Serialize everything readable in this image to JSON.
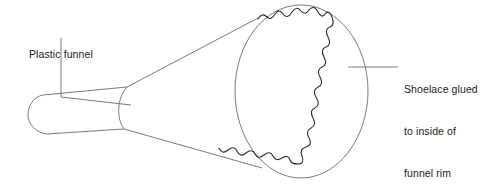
{
  "figure": {
    "background_color": "#ffffff",
    "line_color": "#6b6b6b",
    "shoelace_color": "#2b2b2b",
    "text_color": "#1a1a1a",
    "width": 503,
    "height": 193
  },
  "labels": {
    "plastic_funnel": "Plastic funnel",
    "bubble_pipe": "The bubble pipe",
    "shoelace_line1": "Shoelace glued",
    "shoelace_line2": "to inside of",
    "shoelace_line3": "funnel rim"
  },
  "parts": {
    "funnel_rim_name": "funnel-rim-ellipse",
    "funnel_cone_name": "funnel-cone",
    "funnel_stem_name": "funnel-stem",
    "shoelace_name": "shoelace-wavy-line"
  },
  "leaders": {
    "plastic_funnel_leader": "vertical-then-diagonal",
    "shoelace_leader": "horizontal"
  }
}
